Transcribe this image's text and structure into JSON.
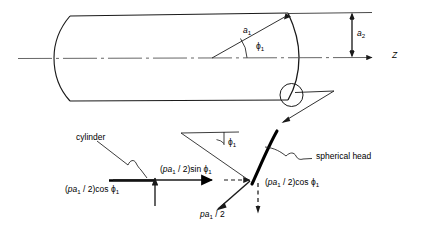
{
  "figure": {
    "line_color": "#1a1a1a",
    "accent_color": "#000000"
  },
  "upper_diagram": {
    "name": "cylindrical-pressure-vessel",
    "axis_label": "Z",
    "radius_label_main": "a",
    "radius_label_sub": "1",
    "angle_label_main": "ϕ",
    "angle_label_sub": "1",
    "height_label_main": "a",
    "height_label_sub": "2"
  },
  "detail_diagram": {
    "name": "free-body-force-detail",
    "cylinder_label": "cylinder",
    "head_label": "spherical head",
    "angle_label_main": "ϕ",
    "angle_label_sub": "1",
    "forces": [
      {
        "name": "axial-sin-component",
        "prefix": "(",
        "p": "p",
        "a": "a",
        "a_sub": "1",
        "mid": " / 2)sin ",
        "phi": "ϕ",
        "phi_sub": "1"
      },
      {
        "name": "left-cos-component",
        "prefix": "(",
        "p": "p",
        "a": "a",
        "a_sub": "1",
        "mid": " / 2)cos ",
        "phi": "ϕ",
        "phi_sub": "1"
      },
      {
        "name": "right-cos-component",
        "prefix": "(",
        "p": "p",
        "a": "a",
        "a_sub": "1",
        "mid": " / 2)cos ",
        "phi": "ϕ",
        "phi_sub": "1"
      },
      {
        "name": "resultant-force",
        "p": "p",
        "a": "a",
        "a_sub": "1",
        "mid": " / 2"
      }
    ]
  }
}
